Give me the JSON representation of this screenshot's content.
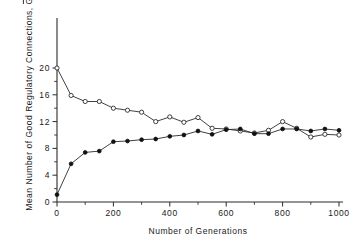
{
  "chart_data": {
    "type": "line",
    "title": "",
    "xlabel": "Number of Generations",
    "ylabel": "Mean Number of Good Regulatory Connections, G",
    "ylabel_symbol": "G",
    "ylabel_symbol_has_overbar": true,
    "ylabel_prefix": "Mean Number of Good Regulatory Connections,",
    "x": [
      0,
      50,
      100,
      150,
      200,
      250,
      300,
      350,
      400,
      450,
      500,
      550,
      600,
      650,
      700,
      750,
      800,
      850,
      900,
      950,
      1000
    ],
    "xlim": [
      0,
      1000
    ],
    "ylim": [
      0,
      22
    ],
    "xticks": [
      0,
      200,
      400,
      600,
      800,
      1000
    ],
    "xtick_labels": [
      "0",
      "200",
      "400",
      "600",
      "800",
      "1000"
    ],
    "xticks_minor": [
      100,
      300,
      500,
      700,
      900
    ],
    "yticks": [
      0,
      4,
      8,
      12,
      16,
      20
    ],
    "ytick_labels": [
      "0",
      "4",
      "8",
      "12",
      "16",
      "20"
    ],
    "yticks_minor": [
      2,
      6,
      10,
      14,
      18
    ],
    "grid": false,
    "legend": "none",
    "series": [
      {
        "name": "decreasing-open-circles",
        "marker": "open-circle",
        "values": [
          20.0,
          15.9,
          15.0,
          15.0,
          14.0,
          13.7,
          13.4,
          12.0,
          12.7,
          11.9,
          12.6,
          11.0,
          10.9,
          10.6,
          10.3,
          10.7,
          12.0,
          11.0,
          9.7,
          10.1,
          10.0
        ]
      },
      {
        "name": "increasing-filled-circles",
        "marker": "filled-circle",
        "values": [
          1.1,
          5.7,
          7.4,
          7.6,
          9.0,
          9.1,
          9.3,
          9.4,
          9.8,
          10.0,
          10.6,
          10.1,
          10.8,
          10.9,
          10.2,
          10.2,
          10.9,
          10.9,
          10.6,
          10.9,
          10.7
        ]
      }
    ]
  }
}
